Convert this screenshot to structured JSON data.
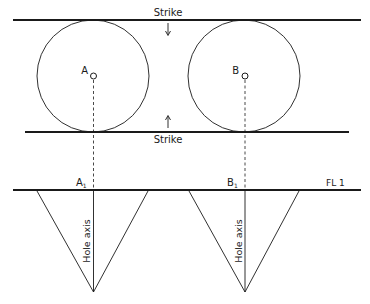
{
  "diagram": {
    "labels": {
      "strike_top": "Strike",
      "strike_bottom": "Strike",
      "point_a": "A",
      "point_b": "B",
      "point_a1": "A",
      "point_a1_sub": "1",
      "point_b1": "B",
      "point_b1_sub": "1",
      "floor_level": "FL 1",
      "hole_axis_a": "Hole axis",
      "hole_axis_b": "Hole axis"
    },
    "colors": {
      "line": "#1a1a1a",
      "background": "#ffffff"
    }
  }
}
